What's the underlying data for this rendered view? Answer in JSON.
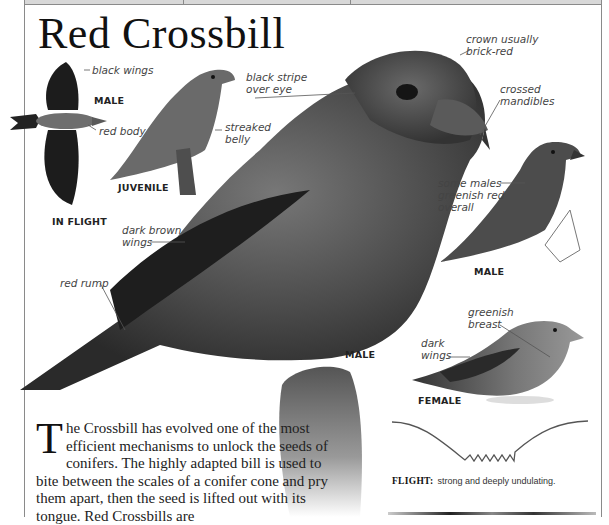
{
  "page": {
    "title": "Red Crossbill",
    "colors": {
      "text": "#222222",
      "frame": "#8a8a8a",
      "background": "#ffffff"
    }
  },
  "illustrations": {
    "in_flight": {
      "caption": "IN FLIGHT",
      "sex": "MALE",
      "labels": [
        "black wings",
        "red body"
      ]
    },
    "juvenile": {
      "caption": "JUVENILE",
      "labels": [
        "streaked belly"
      ]
    },
    "main_male": {
      "caption": "MALE",
      "labels": [
        "black stripe over eye",
        "crown usually brick-red",
        "crossed mandibles",
        "dark brown wings",
        "red rump"
      ]
    },
    "male_variant": {
      "caption": "MALE",
      "labels": [
        "some males greenish red overall"
      ]
    },
    "female": {
      "caption": "FEMALE",
      "labels": [
        "greenish breast",
        "dark wings"
      ]
    }
  },
  "labels": {
    "black_wings": "black wings",
    "male_flight": "MALE",
    "red_body": "red body",
    "in_flight": "IN FLIGHT",
    "juvenile": "JUVENILE",
    "streaked_belly_1": "streaked",
    "streaked_belly_2": "belly",
    "black_stripe_1": "black stripe",
    "black_stripe_2": "over eye",
    "crown_1": "crown usually",
    "crown_2": "brick-red",
    "crossed_1": "crossed",
    "crossed_2": "mandibles",
    "some_males_1": "some males",
    "some_males_2": "greenish red",
    "some_males_3": "overall",
    "male_right": "MALE",
    "dark_brown_1": "dark brown",
    "dark_brown_2": "wings",
    "red_rump": "red rump",
    "male_main": "MALE",
    "greenish_1": "greenish",
    "greenish_2": "breast",
    "dark_wings_1": "dark",
    "dark_wings_2": "wings",
    "female": "FEMALE"
  },
  "description": {
    "dropcap": "T",
    "text": "he Crossbill has evolved one of the most efficient mechanisms to unlock the seeds of conifers. The highly adapted bill is used to bite between the scales of a conifer cone and pry them apart, then the seed is lifted out with its tongue. Red Crossbills are"
  },
  "flight": {
    "label": "FLIGHT:",
    "text": "strong and deeply undulating."
  }
}
